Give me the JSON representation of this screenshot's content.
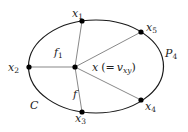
{
  "diagram": {
    "type": "plane graph fragment",
    "cycle_label": "C",
    "path_label": "P",
    "path_index": "4",
    "face_labels": [
      {
        "name": "f",
        "index": "1"
      },
      {
        "name": "f",
        "index": ""
      }
    ],
    "center_vertex": {
      "name": "x",
      "annotation_prefix": "(=",
      "annotation_var": "v",
      "annotation_sub": "xy",
      "annotation_suffix": ")"
    },
    "vertices": [
      {
        "name": "x",
        "index": "1"
      },
      {
        "name": "x",
        "index": "2"
      },
      {
        "name": "x",
        "index": "3"
      },
      {
        "name": "x",
        "index": "4"
      },
      {
        "name": "x",
        "index": "5"
      }
    ],
    "edges_from_center": [
      "x1",
      "x2",
      "x3",
      "x4",
      "x5"
    ],
    "colors": {
      "stroke": "#1a1a1a",
      "spoke": "#555555",
      "vertex": "#000000",
      "text": "#222222"
    }
  }
}
